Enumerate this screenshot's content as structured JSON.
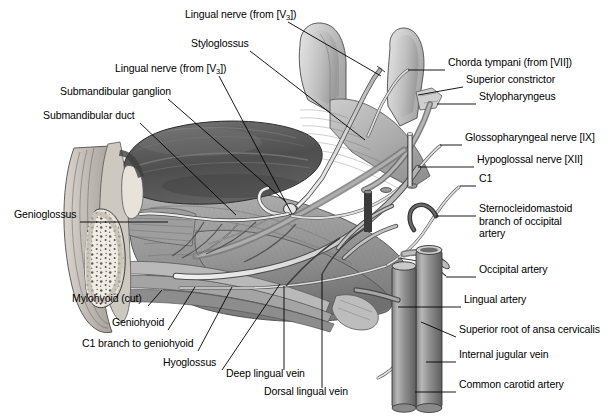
{
  "figure": {
    "style": "grayscale anatomical illustration",
    "width": 609,
    "height": 419,
    "background": "#ffffff"
  },
  "palette": {
    "ink": "#000000",
    "background": "#ffffff",
    "gland_dark": "#5b5b5b",
    "muscle_mid": "#9a9a9a",
    "muscle_light": "#c3c3c3",
    "tongue_light": "#cfcfcf",
    "bone_light": "#efeae2",
    "nerve_pale": "#e2e2e2",
    "vessel_mid": "#8c8c8c",
    "vessel_dark": "#565656",
    "outline": "#3a3a3a"
  },
  "labels_left": [
    {
      "id": "lingual-nerve-v3-upper",
      "text": "Lingual nerve (from [V3])",
      "pre": "Lingual nerve (from [V",
      "sub": "3",
      "post": "])",
      "x": 185,
      "y": 16,
      "anchor_x": 288,
      "anchor_y": 22,
      "tip_x": 381,
      "tip_y": 76
    },
    {
      "id": "styloglossus",
      "text": "Styloglossus",
      "pre": "Styloglossus",
      "sub": "",
      "post": "",
      "x": 191,
      "y": 45,
      "anchor_x": 250,
      "anchor_y": 51,
      "tip_x": 365,
      "tip_y": 140
    },
    {
      "id": "lingual-nerve-v3-lower",
      "text": "Lingual nerve (from [V3])",
      "pre": "Lingual nerve (from [V",
      "sub": "3",
      "post": "])",
      "x": 115,
      "y": 70,
      "anchor_x": 219,
      "anchor_y": 76,
      "tip_x": 292,
      "tip_y": 214
    },
    {
      "id": "submandibular-ganglion",
      "text": "Submandibular ganglion",
      "pre": "Submandibular ganglion",
      "sub": "",
      "post": "",
      "x": 60,
      "y": 93,
      "anchor_x": 168,
      "anchor_y": 99,
      "tip_x": 286,
      "tip_y": 202
    },
    {
      "id": "submandibular-duct",
      "text": "Submandibular duct",
      "pre": "Submandibular duct",
      "sub": "",
      "post": "",
      "x": 43,
      "y": 117,
      "anchor_x": 140,
      "anchor_y": 123,
      "tip_x": 236,
      "tip_y": 215
    },
    {
      "id": "genioglossus",
      "text": "Genioglossus",
      "pre": "Genioglossus",
      "sub": "",
      "post": "",
      "x": 14,
      "y": 216,
      "anchor_x": 80,
      "anchor_y": 222,
      "tip_x": 168,
      "tip_y": 222
    },
    {
      "id": "mylohyoid-cut",
      "text": "Mylohyoid (cut)",
      "pre": "Mylohyoid (cut)",
      "sub": "",
      "post": "",
      "x": 72,
      "y": 300,
      "anchor_x": 148,
      "anchor_y": 306,
      "tip_x": 162,
      "tip_y": 290
    },
    {
      "id": "geniohyoid",
      "text": "Geniohyoid",
      "pre": "Geniohyoid",
      "sub": "",
      "post": "",
      "x": 112,
      "y": 324,
      "anchor_x": 168,
      "anchor_y": 330,
      "tip_x": 195,
      "tip_y": 287
    },
    {
      "id": "c1-branch-to-geniohyoid",
      "text": "C1 branch to geniohyoid",
      "pre": "C1 branch to geniohyoid",
      "sub": "",
      "post": "",
      "x": 82,
      "y": 345,
      "anchor_x": 198,
      "anchor_y": 351,
      "tip_x": 232,
      "tip_y": 287
    },
    {
      "id": "hyoglossus",
      "text": "Hyoglossus",
      "pre": "Hyoglossus",
      "sub": "",
      "post": "",
      "x": 163,
      "y": 364,
      "anchor_x": 222,
      "anchor_y": 370,
      "tip_x": 280,
      "tip_y": 284
    },
    {
      "id": "deep-lingual-vein",
      "text": "Deep lingual vein",
      "pre": "Deep lingual vein",
      "sub": "",
      "post": "",
      "x": 226,
      "y": 375,
      "anchor_x": 284,
      "anchor_y": 370,
      "tip_x": 284,
      "tip_y": 286
    },
    {
      "id": "dorsal-lingual-vein",
      "text": "Dorsal lingual vein",
      "pre": "Dorsal lingual vein",
      "sub": "",
      "post": "",
      "x": 264,
      "y": 393,
      "anchor_x": 322,
      "anchor_y": 388,
      "tip_x": 322,
      "tip_y": 274
    }
  ],
  "labels_right": [
    {
      "id": "chorda-tympani",
      "text": "Chorda tympani (from [VII])",
      "pre": "Chorda tympani (from [VII])",
      "sub": "",
      "post": "",
      "x": 448,
      "y": 64,
      "anchor_x": 445,
      "anchor_y": 70,
      "tip_x": 408,
      "tip_y": 70
    },
    {
      "id": "superior-constrictor",
      "text": "Superior constrictor",
      "pre": "Superior constrictor",
      "sub": "",
      "post": "",
      "x": 466,
      "y": 81,
      "anchor_x": 463,
      "anchor_y": 87,
      "tip_x": 418,
      "tip_y": 95
    },
    {
      "id": "stylopharyngeus",
      "text": "Stylopharyngeus",
      "pre": "Stylopharyngeus",
      "sub": "",
      "post": "",
      "x": 479,
      "y": 98,
      "anchor_x": 476,
      "anchor_y": 104,
      "tip_x": 437,
      "tip_y": 104
    },
    {
      "id": "glossopharyngeal-nerve",
      "text": "Glossopharyngeal nerve [IX]",
      "pre": "Glossopharyngeal nerve [IX]",
      "sub": "",
      "post": "",
      "x": 465,
      "y": 139,
      "anchor_x": 462,
      "anchor_y": 145,
      "tip_x": 440,
      "tip_y": 145
    },
    {
      "id": "hypoglossal-nerve",
      "text": "Hypoglossal nerve [XII]",
      "pre": "Hypoglossal nerve [XII]",
      "sub": "",
      "post": "",
      "x": 477,
      "y": 161,
      "anchor_x": 474,
      "anchor_y": 167,
      "tip_x": 418,
      "tip_y": 167
    },
    {
      "id": "c1",
      "text": "C1",
      "pre": "C1",
      "sub": "",
      "post": "",
      "x": 479,
      "y": 180,
      "anchor_x": 476,
      "anchor_y": 186,
      "tip_x": 460,
      "tip_y": 186
    },
    {
      "id": "sternocleidomastoid-branch",
      "text": "Sternocleidomastoid branch of occipital artery",
      "pre": "Sternocleidomastoid\nbranch of occipital\nartery",
      "sub": "",
      "post": "",
      "x": 479,
      "y": 210,
      "anchor_x": 476,
      "anchor_y": 216,
      "tip_x": 436,
      "tip_y": 216
    },
    {
      "id": "occipital-artery",
      "text": "Occipital artery",
      "pre": "Occipital artery",
      "sub": "",
      "post": "",
      "x": 479,
      "y": 271,
      "anchor_x": 476,
      "anchor_y": 277,
      "tip_x": 446,
      "tip_y": 277
    },
    {
      "id": "lingual-artery",
      "text": "Lingual artery",
      "pre": "Lingual artery",
      "sub": "",
      "post": "",
      "x": 464,
      "y": 301,
      "anchor_x": 461,
      "anchor_y": 307,
      "tip_x": 398,
      "tip_y": 307
    },
    {
      "id": "superior-root-ansa-cervicalis",
      "text": "Superior root of ansa cervicalis",
      "pre": "Superior root of ansa cervicalis",
      "sub": "",
      "post": "",
      "x": 459,
      "y": 331,
      "anchor_x": 456,
      "anchor_y": 337,
      "tip_x": 421,
      "tip_y": 322
    },
    {
      "id": "internal-jugular-vein",
      "text": "Internal jugular vein",
      "pre": "Internal jugular vein",
      "sub": "",
      "post": "",
      "x": 459,
      "y": 356,
      "anchor_x": 456,
      "anchor_y": 362,
      "tip_x": 426,
      "tip_y": 362
    },
    {
      "id": "common-carotid-artery",
      "text": "Common carotid artery",
      "pre": "Common carotid artery",
      "sub": "",
      "post": "",
      "x": 459,
      "y": 386,
      "anchor_x": 456,
      "anchor_y": 392,
      "tip_x": 415,
      "tip_y": 392
    }
  ],
  "structures": [
    {
      "id": "submandibular-gland",
      "name": "Submandibular gland",
      "tone": "dark gray"
    },
    {
      "id": "tongue-body",
      "name": "Tongue / genioglossus mass",
      "tone": "light gray"
    },
    {
      "id": "mandible",
      "name": "Mandible cross-section with trabecular bone",
      "tone": "pale"
    },
    {
      "id": "pharyngeal-wall",
      "name": "Superior constrictor / pharyngeal wall",
      "tone": "mid gray"
    },
    {
      "id": "carotid-sheath",
      "name": "Common carotid artery and internal jugular vein",
      "tone": "mid gray"
    },
    {
      "id": "nerve-bundle",
      "name": "Hypoglossal, glossopharyngeal, lingual nerves",
      "tone": "pale"
    }
  ]
}
